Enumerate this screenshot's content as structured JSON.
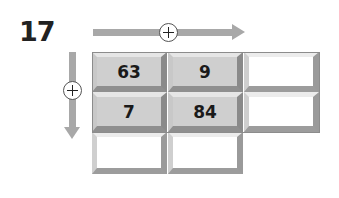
{
  "question_number": "17",
  "operation_symbol": "+",
  "horizontal_arrow": {
    "direction": "right",
    "icon": "plus-circle-icon"
  },
  "vertical_arrow": {
    "direction": "down",
    "icon": "plus-circle-icon"
  },
  "grid": {
    "rows": [
      {
        "cells": [
          {
            "value": "63",
            "filled": true
          },
          {
            "value": "9",
            "filled": true
          },
          {
            "value": "",
            "filled": false
          }
        ]
      },
      {
        "cells": [
          {
            "value": "7",
            "filled": true
          },
          {
            "value": "84",
            "filled": true
          },
          {
            "value": "",
            "filled": false
          }
        ]
      },
      {
        "cells": [
          {
            "value": "",
            "filled": false
          },
          {
            "value": "",
            "filled": false
          }
        ]
      }
    ]
  }
}
